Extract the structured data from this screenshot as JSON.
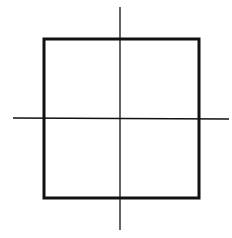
{
  "diagram": {
    "background": "#ffffff",
    "stroke_color": "#111111",
    "square": {
      "x": 44,
      "y": 39,
      "width": 155,
      "height": 159,
      "stroke_width": 3
    },
    "horizontal_axis": {
      "x1": 13,
      "y1": 118,
      "x2": 229,
      "y2": 119,
      "stroke_width": 1.3
    },
    "vertical_axis": {
      "x1": 120,
      "y1": 7,
      "x2": 120,
      "y2": 230,
      "stroke_width": 1.3
    }
  }
}
